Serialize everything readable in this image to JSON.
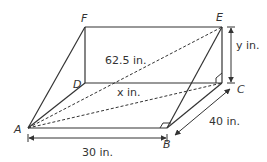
{
  "diagram": {
    "type": "3D rectangular box with ramp (wedge) and diagonals",
    "vertices": {
      "A": "A",
      "B": "B",
      "C": "C",
      "D": "D",
      "E": "E",
      "F": "F"
    },
    "labels": {
      "diagonal_AE": "62.5 in.",
      "diagonal_AC": "x in.",
      "height_CE": "y in.",
      "length_AB": "30 in.",
      "width_BC": "40 in."
    },
    "colors": {
      "line": "#333333",
      "background": "#ffffff"
    }
  }
}
